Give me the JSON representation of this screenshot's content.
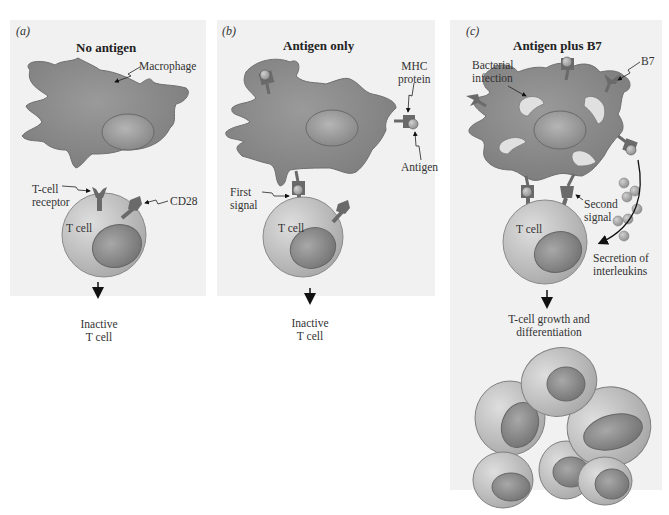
{
  "figure": {
    "panels": [
      {
        "id": "a",
        "letter": "(a)",
        "title": "No antigen",
        "labels": {
          "macrophage": "Macrophage",
          "tcr_line1": "T-cell",
          "tcr_line2": "receptor",
          "cd28": "CD28",
          "tcell": "T cell",
          "outcome_line1": "Inactive",
          "outcome_line2": "T cell"
        }
      },
      {
        "id": "b",
        "letter": "(b)",
        "title": "Antigen only",
        "labels": {
          "mhc_line1": "MHC",
          "mhc_line2": "protein",
          "antigen": "Antigen",
          "first_line1": "First",
          "first_line2": "signal",
          "tcell": "T cell",
          "outcome_line1": "Inactive",
          "outcome_line2": "T cell"
        }
      },
      {
        "id": "c",
        "letter": "(c)",
        "title": "Antigen plus B7",
        "labels": {
          "bact_line1": "Bacterial",
          "bact_line2": "infection",
          "b7": "B7",
          "second_line1": "Second",
          "second_line2": "signal",
          "tcell": "T cell",
          "secretion_line1": "Secretion of",
          "secretion_line2": "interleukins",
          "outcome_line1": "T-cell growth and",
          "outcome_line2": "differentiation"
        }
      }
    ],
    "colors": {
      "panel_bg": "#f1f1f1",
      "macrophage": "#8a8a8a",
      "tcell": "#c4c4c4",
      "nucleus": "#8c8c8c",
      "receptor": "#6e6e6e",
      "bacteria": "#dcdcdc",
      "interleukin": "#a9a9a9"
    }
  }
}
